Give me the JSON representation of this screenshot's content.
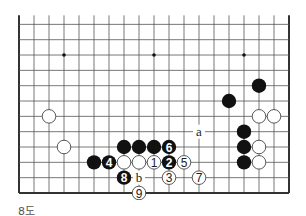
{
  "diagram": {
    "caption": "8도",
    "board": {
      "columns": 19,
      "visible_rows": 12,
      "bottom_edge": true,
      "left_edge": true,
      "right_edge": true,
      "top_edge": false,
      "grid": {
        "x0": 19,
        "dx": 15,
        "y_bottom": 193,
        "dy": 15.33
      },
      "star_points": [
        {
          "col": 3,
          "row": 9
        },
        {
          "col": 9,
          "row": 9
        },
        {
          "col": 15,
          "row": 9
        }
      ]
    },
    "stones": [
      {
        "color": "white",
        "col": 2,
        "row": 5,
        "label": ""
      },
      {
        "color": "white",
        "col": 3,
        "row": 3,
        "label": ""
      },
      {
        "color": "black",
        "col": 7,
        "row": 3,
        "label": ""
      },
      {
        "color": "black",
        "col": 8,
        "row": 3,
        "label": ""
      },
      {
        "color": "black",
        "col": 9,
        "row": 3,
        "label": ""
      },
      {
        "color": "black",
        "col": 10,
        "row": 3,
        "label": "6"
      },
      {
        "color": "black",
        "col": 5,
        "row": 2,
        "label": ""
      },
      {
        "color": "black",
        "col": 6,
        "row": 2,
        "label": "4"
      },
      {
        "color": "white",
        "col": 7,
        "row": 2,
        "label": ""
      },
      {
        "color": "white",
        "col": 8,
        "row": 2,
        "label": ""
      },
      {
        "color": "white",
        "col": 9,
        "row": 2,
        "label": "1"
      },
      {
        "color": "black",
        "col": 10,
        "row": 2,
        "label": "2"
      },
      {
        "color": "white",
        "col": 11,
        "row": 2,
        "label": "5"
      },
      {
        "color": "black",
        "col": 7,
        "row": 1,
        "label": "8"
      },
      {
        "color": "white",
        "col": 10,
        "row": 1,
        "label": "3"
      },
      {
        "color": "white",
        "col": 12,
        "row": 1,
        "label": "7"
      },
      {
        "color": "white",
        "col": 8,
        "row": 0,
        "label": "9"
      },
      {
        "color": "black",
        "col": 16,
        "row": 7,
        "label": ""
      },
      {
        "color": "black",
        "col": 14,
        "row": 6,
        "label": ""
      },
      {
        "color": "white",
        "col": 16,
        "row": 5,
        "label": ""
      },
      {
        "color": "white",
        "col": 17,
        "row": 5,
        "label": ""
      },
      {
        "color": "black",
        "col": 15,
        "row": 4,
        "label": ""
      },
      {
        "color": "black",
        "col": 15,
        "row": 3,
        "label": ""
      },
      {
        "color": "white",
        "col": 16,
        "row": 3,
        "label": ""
      },
      {
        "color": "black",
        "col": 15,
        "row": 2,
        "label": ""
      },
      {
        "color": "white",
        "col": 16,
        "row": 2,
        "label": ""
      }
    ],
    "markers": [
      {
        "text": "a",
        "col": 12,
        "row": 4
      },
      {
        "text": "b",
        "col": 8,
        "row": 1
      }
    ],
    "colors": {
      "line": "#555555",
      "edge": "#333333",
      "black_stone": "#111111",
      "white_stone": "#ffffff",
      "white_stroke": "#444444",
      "background": "#ffffff"
    }
  }
}
